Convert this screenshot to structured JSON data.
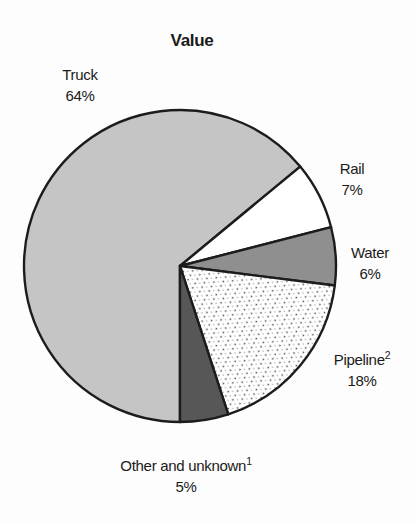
{
  "chart_data": {
    "type": "pie",
    "title": "Value",
    "unit": "percent",
    "direction": "clockwise",
    "start_bearing_deg": 180,
    "legend": "none",
    "labels_position": "outside",
    "outline_color": "#1c1c1c",
    "background_color": "#fdfdfd",
    "slices": [
      {
        "label": "Truck",
        "footnote_sup": "",
        "value": 64,
        "pct": "64%",
        "fill": "#c5c5c5",
        "texture": "solid"
      },
      {
        "label": "Rail",
        "footnote_sup": "",
        "value": 7,
        "pct": "7%",
        "fill": "#ffffff",
        "texture": "solid"
      },
      {
        "label": "Water",
        "footnote_sup": "",
        "value": 6,
        "pct": "6%",
        "fill": "#8f8f8f",
        "texture": "solid"
      },
      {
        "label": "Pipeline",
        "footnote_sup": "2",
        "value": 18,
        "pct": "18%",
        "fill": "#ffffff",
        "texture": "dotted-hatch"
      },
      {
        "label": "Other and unknown",
        "footnote_sup": "1",
        "value": 5,
        "pct": "5%",
        "fill": "#575757",
        "texture": "solid"
      }
    ]
  }
}
